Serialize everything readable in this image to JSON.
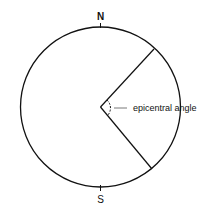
{
  "diagram": {
    "north_label": "N",
    "south_label": "S",
    "angle_label": "epicentral angle",
    "stroke_color": "#111111",
    "background": "#ffffff"
  }
}
